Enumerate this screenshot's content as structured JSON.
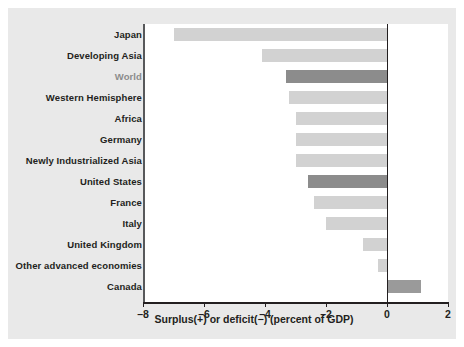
{
  "chart_data": {
    "type": "bar",
    "orientation": "horizontal",
    "title": "",
    "xlabel": "Surplus(+) or deficit(−) (percent of GDP)",
    "ylabel": "",
    "xlim": [
      -8,
      2
    ],
    "xticks": [
      -8,
      -6,
      -4,
      -2,
      0,
      2
    ],
    "xtick_labels": [
      "–8",
      "–6",
      "–4",
      "–2",
      "0",
      "2"
    ],
    "grid": false,
    "legend": null,
    "categories": [
      "Japan",
      "Developing Asia",
      "World",
      "Western Hemisphere",
      "Africa",
      "Germany",
      "Newly Industrialized Asia",
      "United States",
      "France",
      "Italy",
      "United Kingdom",
      "Other advanced economies",
      "Canada"
    ],
    "values": [
      -7.0,
      -4.1,
      -3.3,
      -3.2,
      -3.0,
      -3.0,
      -3.0,
      -2.6,
      -2.4,
      -2.0,
      -0.8,
      -0.3,
      1.1
    ],
    "highlighted": [
      "World",
      "United States"
    ],
    "colors": {
      "bar_light": "#d2d2d2",
      "bar_dark": "#8c8c8c",
      "bar_canada": "#9a9a9a",
      "axis": "#231f20",
      "axis_vertical": "#58595b",
      "panel_background": "#e9e9e9",
      "plot_background": "#ffffff",
      "label_text": "#231f20",
      "label_highlight_text": "#8c8c8c"
    }
  }
}
